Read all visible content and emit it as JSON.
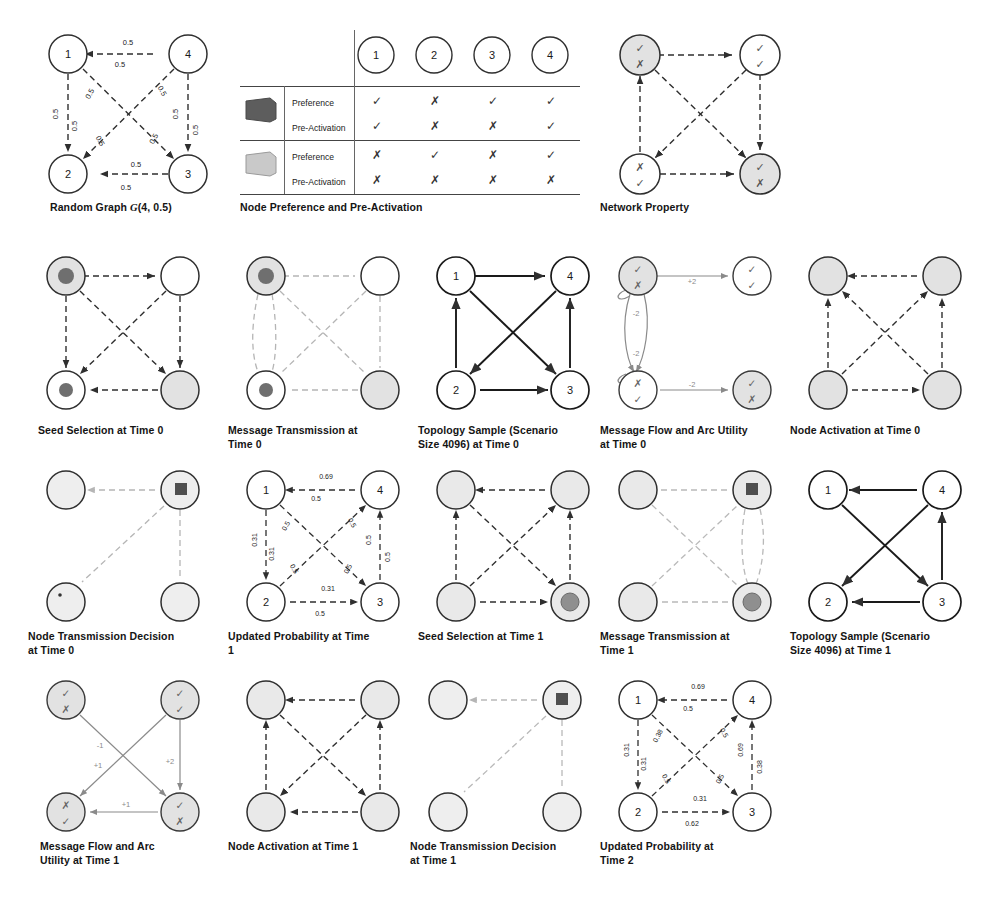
{
  "figure": {
    "title": "",
    "node_labels": [
      "1",
      "2",
      "3",
      "4"
    ],
    "edge_probability_default": "0.5"
  },
  "panels": [
    {
      "id": "random-graph",
      "caption_plain": "Random Graph G(4, 0.5)",
      "caption_prefix": "Random Graph ",
      "caption_italic": "G",
      "caption_suffix": "(4, 0.5)",
      "node_labels": [
        "1",
        "4",
        "2",
        "3"
      ],
      "edge_labels": {
        "top_above": "0.5",
        "top_below": "0.5",
        "left_left": "0.5",
        "left_right": "0.5",
        "right_left": "0.5",
        "right_right": "0.5",
        "bottom_above": "0.5",
        "bottom_below": "0.5",
        "diag_tl_a": "0.5",
        "diag_tl_b": "0.5",
        "diag_tr_a": "0.5",
        "diag_tr_b": "0.5"
      }
    },
    {
      "id": "node-preference-table",
      "caption_plain": "Node Preference and Pre-Activation",
      "column_headers": [
        "1",
        "2",
        "3",
        "4"
      ],
      "groups": [
        {
          "chip": "dark",
          "rows": [
            {
              "label": "Preference",
              "values": [
                "check",
                "cross",
                "check",
                "check"
              ]
            },
            {
              "label": "Pre-Activation",
              "values": [
                "check",
                "cross",
                "cross",
                "check"
              ]
            }
          ]
        },
        {
          "chip": "light",
          "rows": [
            {
              "label": "Preference",
              "values": [
                "cross",
                "check",
                "cross",
                "check"
              ]
            },
            {
              "label": "Pre-Activation",
              "values": [
                "cross",
                "cross",
                "cross",
                "cross"
              ]
            }
          ]
        }
      ]
    },
    {
      "id": "network-property",
      "caption_plain": "Network Property",
      "nodes": [
        {
          "pos": "tl",
          "fill": "shaded",
          "top": "check",
          "bottom": "cross"
        },
        {
          "pos": "tr",
          "fill": "white",
          "top": "check",
          "bottom": "check"
        },
        {
          "pos": "bl",
          "fill": "white",
          "top": "cross",
          "bottom": "check"
        },
        {
          "pos": "br",
          "fill": "shaded",
          "top": "check",
          "bottom": "cross"
        }
      ]
    },
    {
      "id": "seed-selection-t0",
      "caption_plain": "Seed Selection at Time 0",
      "nodes": [
        {
          "pos": "tl",
          "fill": "shaded",
          "inner": "dot"
        },
        {
          "pos": "tr",
          "fill": "white",
          "inner": "none"
        },
        {
          "pos": "bl",
          "fill": "white",
          "inner": "dot"
        },
        {
          "pos": "br",
          "fill": "shaded",
          "inner": "none"
        }
      ]
    },
    {
      "id": "message-transmission-t0",
      "caption_plain": "Message Transmission at Time 0",
      "nodes": [
        {
          "pos": "tl",
          "fill": "shaded",
          "inner": "dot"
        },
        {
          "pos": "tr",
          "fill": "white",
          "inner": "none"
        },
        {
          "pos": "bl",
          "fill": "white",
          "inner": "dot"
        },
        {
          "pos": "br",
          "fill": "shaded",
          "inner": "none"
        }
      ]
    },
    {
      "id": "topology-sample-t0",
      "caption_plain": "Topology Sample (Scenario Size 4096) at Time 0",
      "node_labels": [
        "1",
        "4",
        "2",
        "3"
      ],
      "edges_present": [
        "top",
        "left",
        "right",
        "bottom",
        "diag-tl-br",
        "diag-tr-bl"
      ]
    },
    {
      "id": "message-flow-arc-utility-t0",
      "caption_plain": "Message Flow and Arc Utility at Time 0",
      "nodes": [
        {
          "pos": "tl",
          "fill": "shaded",
          "top": "check",
          "bottom": "cross"
        },
        {
          "pos": "tr",
          "fill": "white",
          "top": "check",
          "bottom": "check"
        },
        {
          "pos": "bl",
          "fill": "white",
          "top": "cross",
          "bottom": "check"
        },
        {
          "pos": "br",
          "fill": "shaded",
          "top": "check",
          "bottom": "cross"
        }
      ],
      "arc_labels": {
        "top": "+2",
        "upper_curve": "-2",
        "lower_curve": "-2",
        "bottom": "-2"
      }
    },
    {
      "id": "node-activation-t0",
      "caption_plain": "Node Activation at Time 0",
      "nodes": [
        {
          "pos": "tl",
          "fill": "shaded"
        },
        {
          "pos": "tr",
          "fill": "shaded"
        },
        {
          "pos": "bl",
          "fill": "shaded"
        },
        {
          "pos": "br",
          "fill": "shaded"
        }
      ]
    },
    {
      "id": "node-transmission-decision-t0",
      "caption_plain": "Node Transmission Decision at Time 0",
      "nodes": [
        {
          "pos": "tl",
          "fill": "shaded",
          "inner": "none"
        },
        {
          "pos": "tr",
          "fill": "shaded",
          "inner": "square"
        },
        {
          "pos": "bl",
          "fill": "shaded",
          "inner": "tiny-dot"
        },
        {
          "pos": "br",
          "fill": "shaded",
          "inner": "none"
        }
      ],
      "edges_present": [
        "top",
        "right",
        "diag-tr-bl"
      ]
    },
    {
      "id": "updated-probability-t1",
      "caption_plain": "Updated Probability at Time 1",
      "node_labels": [
        "1",
        "4",
        "2",
        "3"
      ],
      "edge_labels": {
        "top_above": "0.69",
        "top_below": "0.5",
        "left_left": "0.31",
        "left_right": "0.31",
        "right_left": "0.5",
        "right_right": "0.5",
        "bottom_above": "0.31",
        "bottom_below": "0.5",
        "diag_tl_a": "0.5",
        "diag_tl_b": "0.5",
        "diag_tr_a": "0.5",
        "diag_tr_b": "0.5"
      }
    },
    {
      "id": "seed-selection-t1",
      "caption_plain": "Seed Selection at Time 1",
      "nodes": [
        {
          "pos": "tl",
          "fill": "shaded",
          "inner": "none"
        },
        {
          "pos": "tr",
          "fill": "shaded",
          "inner": "none"
        },
        {
          "pos": "bl",
          "fill": "shaded",
          "inner": "none"
        },
        {
          "pos": "br",
          "fill": "shaded",
          "inner": "dot"
        }
      ]
    },
    {
      "id": "message-transmission-t1",
      "caption_plain": "Message Transmission at Time 1",
      "nodes": [
        {
          "pos": "tl",
          "fill": "shaded",
          "inner": "none"
        },
        {
          "pos": "tr",
          "fill": "shaded",
          "inner": "square"
        },
        {
          "pos": "bl",
          "fill": "shaded",
          "inner": "none"
        },
        {
          "pos": "br",
          "fill": "shaded",
          "inner": "dot"
        }
      ]
    },
    {
      "id": "topology-sample-t1",
      "caption_plain": "Topology Sample (Scenario Size 4096) at Time 1",
      "node_labels": [
        "1",
        "4",
        "2",
        "3"
      ],
      "edges_present": [
        "top",
        "right",
        "bottom",
        "diag-tl-br",
        "diag-tr-bl"
      ]
    },
    {
      "id": "message-flow-arc-utility-t1",
      "caption_plain": "Message Flow and Arc Utility at Time 1",
      "nodes": [
        {
          "pos": "tl",
          "fill": "shaded",
          "top": "check",
          "bottom": "cross"
        },
        {
          "pos": "tr",
          "fill": "shaded",
          "top": "check",
          "bottom": "check"
        },
        {
          "pos": "bl",
          "fill": "shaded",
          "top": "cross",
          "bottom": "check"
        },
        {
          "pos": "br",
          "fill": "shaded",
          "top": "check",
          "bottom": "cross"
        }
      ],
      "arc_labels": {
        "diag_tl_br": "-1",
        "diag_tr_bl": "+1",
        "right": "+2",
        "bottom": "+1"
      }
    },
    {
      "id": "node-activation-t1",
      "caption_plain": "Node Activation at Time 1",
      "nodes": [
        {
          "pos": "tl",
          "fill": "shaded"
        },
        {
          "pos": "tr",
          "fill": "shaded"
        },
        {
          "pos": "bl",
          "fill": "shaded"
        },
        {
          "pos": "br",
          "fill": "shaded"
        }
      ]
    },
    {
      "id": "node-transmission-decision-t1",
      "caption_plain": "Node Transmission Decision at Time 1",
      "nodes": [
        {
          "pos": "tl",
          "fill": "shaded",
          "inner": "none"
        },
        {
          "pos": "tr",
          "fill": "shaded",
          "inner": "square"
        },
        {
          "pos": "bl",
          "fill": "shaded",
          "inner": "none"
        },
        {
          "pos": "br",
          "fill": "shaded",
          "inner": "none"
        }
      ],
      "edges_present": [
        "top",
        "right",
        "diag-tr-bl"
      ]
    },
    {
      "id": "updated-probability-t2",
      "caption_plain": "Updated Probability at Time 2",
      "node_labels": [
        "1",
        "4",
        "2",
        "3"
      ],
      "edge_labels": {
        "top_above": "0.69",
        "top_below": "0.5",
        "left_left": "0.31",
        "left_right": "0.31",
        "right_left": "0.69",
        "right_right": "0.38",
        "bottom_above": "0.31",
        "bottom_below": "0.62",
        "diag_tl_a": "0.38",
        "diag_tl_b": "0.5",
        "diag_tr_a": "0.5",
        "diag_tr_b": "0.5"
      }
    }
  ],
  "captions": {
    "c1": "Random Graph ",
    "c1i": "G",
    "c1b": "(4, 0.5)",
    "c2": "Node Preference and Pre-Activation",
    "c3": "Network Property",
    "c4": "Seed Selection at Time 0",
    "c5l1": "Message Transmission at",
    "c5l2": "Time 0",
    "c6l1": "Topology Sample (Scenario",
    "c6l2": "Size 4096) at Time 0",
    "c7l1": "Message Flow and Arc Utility",
    "c7l2": "at Time 0",
    "c8": "Node Activation at Time 0",
    "c9l1": "Node Transmission Decision",
    "c9l2": "at Time 0",
    "c10l1": "Updated Probability at Time",
    "c10l2": "1",
    "c11": "Seed Selection at Time 1",
    "c12l1": "Message Transmission at",
    "c12l2": "Time 1",
    "c13l1": "Topology Sample (Scenario",
    "c13l2": "Size 4096) at Time 1",
    "c14l1": "Message Flow and Arc",
    "c14l2": "Utility at Time 1",
    "c15": "Node Activation at Time 1",
    "c16l1": "Node Transmission Decision",
    "c16l2": "at Time 1",
    "c17l1": "Updated Probability at",
    "c17l2": "Time 2"
  },
  "table": {
    "headers": [
      "1",
      "2",
      "3",
      "4"
    ],
    "row_labels": [
      "Preference",
      "Pre-Activation",
      "Preference",
      "Pre-Activation"
    ],
    "g1r1": [
      "✓",
      "✗",
      "✓",
      "✓"
    ],
    "g1r2": [
      "✓",
      "✗",
      "✗",
      "✓"
    ],
    "g2r1": [
      "✗",
      "✓",
      "✗",
      "✓"
    ],
    "g2r2": [
      "✗",
      "✗",
      "✗",
      "✗"
    ]
  },
  "edge_labels_rg": {
    "top_above": "0.5",
    "top_below": "0.5",
    "left_a": "0.5",
    "left_b": "0.5",
    "right_a": "0.5",
    "right_b": "0.5",
    "bottom_above": "0.5",
    "bottom_below": "0.5",
    "d1a": "0.5",
    "d1b": "0.5",
    "d2a": "0.5",
    "d2b": "0.5"
  },
  "edge_labels_up1": {
    "top_above": "0.69",
    "top_below": "0.5",
    "left_a": "0.31",
    "left_b": "0.31",
    "right_a": "0.5",
    "right_b": "0.5",
    "bottom_above": "0.31",
    "bottom_below": "0.5",
    "d1a": "0.5",
    "d1b": "0.5",
    "d2a": "0.5",
    "d2b": "0.5"
  },
  "edge_labels_up2": {
    "top_above": "0.69",
    "top_below": "0.5",
    "left_a": "0.31",
    "left_b": "0.31",
    "right_a": "0.69",
    "right_b": "0.38",
    "bottom_above": "0.31",
    "bottom_below": "0.62",
    "d1a": "0.38",
    "d1b": "0.5",
    "d2a": "0.5",
    "d2b": "0.5"
  },
  "arc_t0": {
    "top": "+2",
    "c1": "-2",
    "c2": "-2",
    "bottom": "-2"
  },
  "arc_t1": {
    "d1": "-1",
    "d2": "+1",
    "right": "+2",
    "bottom": "+1"
  },
  "nodes": {
    "n1": "1",
    "n2": "2",
    "n3": "3",
    "n4": "4"
  },
  "colors": {
    "stroke": "#2f2f2f",
    "shade": "#e2e2e2",
    "dark_chip": "#5d5d5d",
    "light_chip": "#c9c9c9",
    "inner_dot": "#6f6f6f",
    "arc_gray": "#8a8a8a"
  }
}
